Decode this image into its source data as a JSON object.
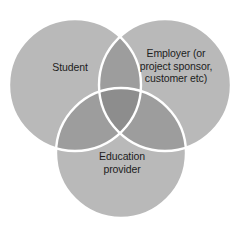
{
  "diagram": {
    "type": "venn",
    "set_count": 3,
    "background_color": "#ffffff",
    "fill_color": "#b9b9b9",
    "overlap_color": "#9d9d9d",
    "center_overlap_color": "#8d8d8d",
    "stroke_color": "#ffffff",
    "text_color": "#1d1d1d",
    "circles": [
      {
        "id": "student",
        "label": "Student",
        "cx": 75,
        "cy": 85,
        "r": 66
      },
      {
        "id": "employer",
        "label": "Employer (or\nproject sponsor,\ncustomer etc)",
        "cx": 165,
        "cy": 85,
        "r": 66
      },
      {
        "id": "education-provider",
        "label": "Education\nprovider",
        "cx": 121,
        "cy": 153,
        "r": 65
      }
    ]
  }
}
